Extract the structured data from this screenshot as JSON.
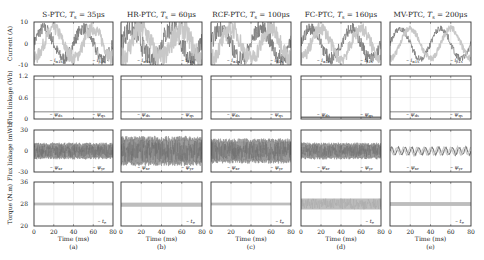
{
  "figure": {
    "columns": [
      {
        "id": "a",
        "title_method": "S-PTC",
        "title_ts": "35μs",
        "caption": "(a)",
        "left": 34,
        "right": 113
      },
      {
        "id": "b",
        "title_method": "HR-PTC",
        "title_ts": "60μs",
        "caption": "(b)",
        "left": 121,
        "right": 202
      },
      {
        "id": "c",
        "title_method": "RCF-PTC",
        "title_ts": "100μs",
        "caption": "(c)",
        "left": 211,
        "right": 291
      },
      {
        "id": "d",
        "title_method": "FC-PTC",
        "title_ts": "160μs",
        "caption": "(d)",
        "left": 301,
        "right": 381
      },
      {
        "id": "e",
        "title_method": "MV-PTC",
        "title_ts": "200μs",
        "caption": "(e)",
        "left": 390,
        "right": 471
      }
    ],
    "ts_label": "T",
    "ts_sub": "s",
    "rows": [
      {
        "id": "current",
        "ylabel": "Current (A)",
        "top": 22,
        "bottom": 65,
        "yticks": [
          "10",
          "0",
          "-10"
        ],
        "legend": [
          "i_α1s",
          "i_β1s"
        ]
      },
      {
        "id": "flux_wb",
        "ylabel": "Flux linkage (Wb)",
        "top": 76,
        "bottom": 119,
        "yticks": [
          "1.2",
          "0.6",
          "0"
        ],
        "legend": [
          "ψ_ds",
          "ψ_qs"
        ]
      },
      {
        "id": "flux_mwb",
        "ylabel": "Flux linkage (mWb)",
        "top": 130,
        "bottom": 172,
        "yticks": [
          "30",
          "0",
          "-30"
        ],
        "legend": [
          "ψ_xr",
          "ψ_yr"
        ]
      },
      {
        "id": "torque",
        "ylabel": "Torque (N.m)",
        "top": 182,
        "bottom": 226,
        "yticks": [
          "36",
          "28",
          "20"
        ],
        "legend": [
          "t_e"
        ]
      }
    ],
    "xaxis": {
      "label": "Time (ms)",
      "ticks": [
        "0",
        "20",
        "40",
        "60",
        "80"
      ]
    },
    "colors": {
      "frame": "#333333",
      "grid": "#dddddd",
      "trace_dark": "#7a7a7a",
      "trace_light": "#c8c8c8",
      "text": "#222222"
    }
  },
  "chart_data": {
    "type": "line",
    "xlabel": "Time (ms)",
    "xlim": [
      0,
      80
    ],
    "grid": true,
    "panels": [
      {
        "column": "(a) S-PTC, Ts = 35μs",
        "current": {
          "ylim": [
            -10,
            10
          ],
          "series": [
            {
              "name": "i_α1s",
              "amplitude": 7,
              "frequency_hz": 25,
              "ripple": 3
            },
            {
              "name": "i_β1s",
              "amplitude": 7,
              "frequency_hz": 25,
              "phase_deg": -90,
              "ripple": 3
            }
          ]
        },
        "flux_wb": {
          "ylim": [
            0,
            1.2
          ],
          "series": [
            {
              "name": "ψ_ds",
              "value": 1.1
            },
            {
              "name": "ψ_qs",
              "value": 0.2
            }
          ]
        },
        "flux_mwb": {
          "ylim": [
            -30,
            30
          ],
          "series": [
            {
              "name": "ψ_xr/ψ_yr",
              "ripple_band": [
                -10,
                10
              ]
            }
          ]
        },
        "torque": {
          "ylim": [
            20,
            36
          ],
          "series": [
            {
              "name": "t_e",
              "value": 28,
              "ripple_band": [
                27.5,
                28.5
              ]
            }
          ]
        }
      },
      {
        "column": "(b) HR-PTC, Ts = 60μs",
        "current": {
          "ylim": [
            -10,
            10
          ],
          "series": [
            {
              "name": "i_α1s",
              "amplitude": 7,
              "frequency_hz": 25,
              "ripple": 5
            },
            {
              "name": "i_β1s",
              "amplitude": 7,
              "frequency_hz": 25,
              "phase_deg": -90,
              "ripple": 5
            }
          ]
        },
        "flux_wb": {
          "ylim": [
            0,
            1.2
          ],
          "series": [
            {
              "name": "ψ_ds",
              "value": 1.1
            },
            {
              "name": "ψ_qs",
              "value": 0.2
            }
          ]
        },
        "flux_mwb": {
          "ylim": [
            -30,
            30
          ],
          "series": [
            {
              "name": "ψ_xr/ψ_yr",
              "ripple_band": [
                -18,
                18
              ]
            }
          ]
        },
        "torque": {
          "ylim": [
            20,
            36
          ],
          "series": [
            {
              "name": "t_e",
              "value": 28,
              "ripple_band": [
                27,
                28.5
              ]
            }
          ]
        }
      },
      {
        "column": "(c) RCF-PTC, Ts = 100μs",
        "current": {
          "ylim": [
            -10,
            10
          ],
          "series": [
            {
              "name": "i_α1s",
              "amplitude": 7,
              "frequency_hz": 25,
              "ripple": 4
            },
            {
              "name": "i_β1s",
              "amplitude": 7,
              "frequency_hz": 25,
              "phase_deg": -90,
              "ripple": 4
            }
          ]
        },
        "flux_wb": {
          "ylim": [
            0,
            1.2
          ],
          "series": [
            {
              "name": "ψ_ds",
              "value": 1.1
            },
            {
              "name": "ψ_qs",
              "value": 0.2
            }
          ]
        },
        "flux_mwb": {
          "ylim": [
            -30,
            30
          ],
          "series": [
            {
              "name": "ψ_xr/ψ_yr",
              "ripple_band": [
                -15,
                15
              ]
            }
          ]
        },
        "torque": {
          "ylim": [
            20,
            36
          ],
          "series": [
            {
              "name": "t_e",
              "value": 28,
              "ripple_band": [
                27.5,
                28.5
              ]
            }
          ]
        }
      },
      {
        "column": "(d) FC-PTC, Ts = 160μs",
        "current": {
          "ylim": [
            -10,
            10
          ],
          "series": [
            {
              "name": "i_α1s",
              "amplitude": 7,
              "frequency_hz": 25,
              "ripple": 3
            },
            {
              "name": "i_β1s",
              "amplitude": 7,
              "frequency_hz": 25,
              "phase_deg": -90,
              "ripple": 3
            }
          ]
        },
        "flux_wb": {
          "ylim": [
            0,
            1.2
          ],
          "series": [
            {
              "name": "ψ_ds",
              "value": 1.1
            },
            {
              "name": "ψ_qs",
              "value": 0.05
            }
          ]
        },
        "flux_mwb": {
          "ylim": [
            -30,
            30
          ],
          "series": [
            {
              "name": "ψ_xr/ψ_yr",
              "ripple_band": [
                -10,
                10
              ]
            }
          ]
        },
        "torque": {
          "ylim": [
            20,
            36
          ],
          "series": [
            {
              "name": "t_e",
              "value": 28,
              "ripple_band": [
                26,
                30
              ]
            }
          ]
        }
      },
      {
        "column": "(e) MV-PTC, Ts = 200μs",
        "current": {
          "ylim": [
            -10,
            10
          ],
          "series": [
            {
              "name": "i_α1s",
              "amplitude": 7,
              "frequency_hz": 25,
              "ripple": 1.5
            },
            {
              "name": "i_β1s",
              "amplitude": 7,
              "frequency_hz": 25,
              "phase_deg": -90,
              "ripple": 1.5
            }
          ]
        },
        "flux_wb": {
          "ylim": [
            0,
            1.2
          ],
          "series": [
            {
              "name": "ψ_ds",
              "value": 1.1
            },
            {
              "name": "ψ_qs",
              "value": 0.2
            }
          ]
        },
        "flux_mwb": {
          "ylim": [
            -30,
            30
          ],
          "series": [
            {
              "name": "ψ_xr/ψ_yr",
              "oscillation_amplitude": 5,
              "oscillations": 12
            }
          ]
        },
        "torque": {
          "ylim": [
            20,
            36
          ],
          "series": [
            {
              "name": "t_e",
              "value": 28,
              "ripple_band": [
                27.3,
                28.7
              ]
            }
          ]
        }
      }
    ]
  }
}
